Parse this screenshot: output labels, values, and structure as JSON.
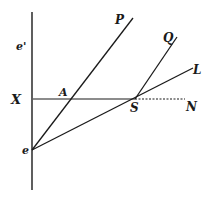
{
  "diagram": {
    "type": "geometric-construction",
    "colors": {
      "ink": "#1a1a1a",
      "background": "#ffffff"
    },
    "labels": {
      "e_prime": "e'",
      "X": "X",
      "A": "A",
      "P": "P",
      "Q": "Q",
      "L": "L",
      "S": "S",
      "N": "N",
      "e": "e"
    },
    "lines": [
      {
        "name": "vertical-axis",
        "from": [
          32,
          12
        ],
        "to": [
          32,
          190
        ]
      },
      {
        "name": "horizontal-line-XN",
        "from": [
          33,
          99
        ],
        "to": [
          185,
          99
        ],
        "style": "solid-then-dotted"
      },
      {
        "name": "line-eP",
        "from": [
          32,
          150
        ],
        "to": [
          133,
          18
        ]
      },
      {
        "name": "line-SQ",
        "from": [
          135,
          99
        ],
        "to": [
          177,
          37
        ]
      },
      {
        "name": "line-eL",
        "from": [
          32,
          150
        ],
        "to": [
          193,
          68
        ]
      }
    ]
  }
}
